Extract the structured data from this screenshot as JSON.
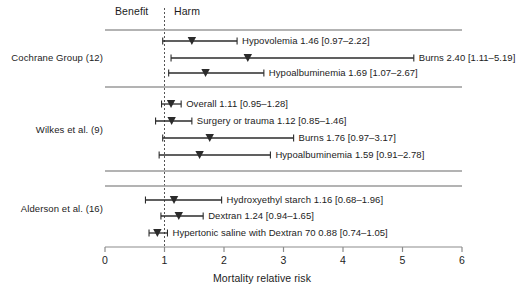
{
  "figure": {
    "axis_title": "Mortality relative risk",
    "header_benefit": "Benefit",
    "header_harm": "Harm",
    "reference_line_value": 1
  },
  "chart_data": {
    "type": "scatter",
    "title": "",
    "xlabel": "Mortality relative risk",
    "ylabel": "",
    "xlim": [
      0,
      6
    ],
    "xticks": [
      0,
      1,
      2,
      3,
      4,
      5,
      6
    ],
    "xticklabels": [
      "0",
      "1",
      "2",
      "3",
      "4",
      "5",
      "6"
    ],
    "grid": false,
    "legend": "none",
    "annotations": [
      "Benefit",
      "Harm"
    ],
    "reference_line": 1,
    "groups": [
      {
        "name": "Cochrane Group (12)",
        "rows": [
          {
            "label": "Hypovolemia 1.46 [0.97–2.22]",
            "name": "Hypovolemia",
            "estimate": 1.46,
            "ci_low": 0.97,
            "ci_high": 2.22
          },
          {
            "label": "Burns 2.40 [1.11–5.19]",
            "name": "Burns",
            "estimate": 2.4,
            "ci_low": 1.11,
            "ci_high": 5.19
          },
          {
            "label": "Hypoalbuminemia 1.69 [1.07–2.67]",
            "name": "Hypoalbuminemia",
            "estimate": 1.69,
            "ci_low": 1.07,
            "ci_high": 2.67
          }
        ]
      },
      {
        "name": "Wilkes et al. (9)",
        "rows": [
          {
            "label": "Overall 1.11 [0.95–1.28]",
            "name": "Overall",
            "estimate": 1.11,
            "ci_low": 0.95,
            "ci_high": 1.28
          },
          {
            "label": "Surgery or trauma 1.12 [0.85–1.46]",
            "name": "Surgery or trauma",
            "estimate": 1.12,
            "ci_low": 0.85,
            "ci_high": 1.46
          },
          {
            "label": "Burns 1.76 [0.97–3.17]",
            "name": "Burns",
            "estimate": 1.76,
            "ci_low": 0.97,
            "ci_high": 3.17
          },
          {
            "label": "Hypoalbuminemia 1.59 [0.91–2.78]",
            "name": "Hypoalbuminemia",
            "estimate": 1.59,
            "ci_low": 0.91,
            "ci_high": 2.78
          }
        ]
      },
      {
        "name": "Alderson et al. (16)",
        "rows": [
          {
            "label": "Hydroxyethyl starch 1.16 [0.68–1.96]",
            "name": "Hydroxyethyl starch",
            "estimate": 1.16,
            "ci_low": 0.68,
            "ci_high": 1.96
          },
          {
            "label": "Dextran 1.24 [0.94–1.65]",
            "name": "Dextran",
            "estimate": 1.24,
            "ci_low": 0.94,
            "ci_high": 1.65
          },
          {
            "label": "Hypertonic saline with Dextran 70 0.88 [0.74–1.05]",
            "name": "Hypertonic saline with Dextran 70",
            "estimate": 0.88,
            "ci_low": 0.74,
            "ci_high": 1.05
          }
        ]
      }
    ]
  },
  "colors": {
    "line": "#2b2b2b",
    "separator": "#9a9a9a",
    "axis": "#8c8c8c",
    "text": "#1c1c1c",
    "reference": "#555555"
  }
}
